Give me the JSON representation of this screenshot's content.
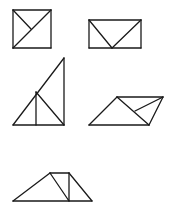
{
  "diagram": {
    "width": 172,
    "height": 214,
    "stroke_color": "#1a1a1a",
    "background": "#ffffff",
    "figures": [
      {
        "name": "square-with-diagonal",
        "segments": [
          [
            13,
            10,
            51,
            10
          ],
          [
            51,
            10,
            51,
            48
          ],
          [
            51,
            48,
            13,
            48
          ],
          [
            13,
            48,
            13,
            10
          ],
          [
            13,
            48,
            51,
            10
          ],
          [
            13,
            10,
            31,
            29
          ]
        ]
      },
      {
        "name": "rectangle-with-v",
        "segments": [
          [
            89,
            20,
            141,
            20
          ],
          [
            141,
            20,
            141,
            48
          ],
          [
            141,
            48,
            89,
            48
          ],
          [
            89,
            48,
            89,
            20
          ],
          [
            89,
            20,
            112,
            48
          ],
          [
            112,
            48,
            141,
            20
          ]
        ]
      },
      {
        "name": "right-triangle-subdivided",
        "segments": [
          [
            13,
            125,
            64,
            125
          ],
          [
            64,
            125,
            64,
            58
          ],
          [
            64,
            58,
            13,
            125
          ],
          [
            36,
            92,
            36,
            125
          ],
          [
            36,
            92,
            64,
            125
          ]
        ]
      },
      {
        "name": "parallelogram-subdivided",
        "segments": [
          [
            89,
            125,
            117,
            97
          ],
          [
            117,
            97,
            163,
            97
          ],
          [
            163,
            97,
            149,
            125
          ],
          [
            149,
            125,
            89,
            125
          ],
          [
            117,
            97,
            149,
            125
          ],
          [
            163,
            97,
            135,
            111
          ]
        ]
      },
      {
        "name": "trapezoid-subdivided",
        "segments": [
          [
            13,
            201,
            92,
            201
          ],
          [
            13,
            201,
            50,
            173
          ],
          [
            50,
            173,
            69,
            173
          ],
          [
            69,
            173,
            92,
            201
          ],
          [
            50,
            173,
            69,
            201
          ],
          [
            69,
            173,
            69,
            201
          ]
        ]
      }
    ]
  }
}
